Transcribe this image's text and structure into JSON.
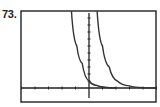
{
  "problem_number": "73.",
  "chart_data": {
    "type": "line",
    "title": "",
    "xlabel": "",
    "ylabel": "",
    "xlim": [
      -5,
      5
    ],
    "ylim": [
      -1,
      11
    ],
    "x_tick_step": 1,
    "y_tick_step": 1,
    "grid": false,
    "legend": null,
    "series": [
      {
        "name": "left curve (exponential decay)",
        "points": [
          [
            -1.3,
            11
          ],
          [
            -0.9,
            6
          ],
          [
            -0.5,
            3.5
          ],
          [
            0,
            1
          ],
          [
            0.5,
            0.4
          ],
          [
            1.2,
            0.1
          ],
          [
            2,
            0
          ]
        ]
      },
      {
        "name": "right curve (exponential decay, shifted right)",
        "points": [
          [
            0.6,
            11
          ],
          [
            1.0,
            6
          ],
          [
            1.5,
            3
          ],
          [
            2.1,
            1
          ],
          [
            3,
            0.3
          ],
          [
            4,
            0.05
          ],
          [
            5,
            0
          ]
        ]
      }
    ]
  },
  "colors": {
    "frame": "#222222",
    "axes": "#222222",
    "curves": "#333333",
    "background": "#ffffff"
  }
}
